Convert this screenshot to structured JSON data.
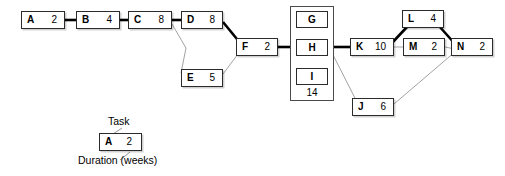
{
  "diagram": {
    "type": "activity-on-node network diagram",
    "critical_path_color": "#000000",
    "normal_edge_color": "#8a8a8a",
    "nodes": [
      {
        "id": "A",
        "task": "A",
        "duration": "2",
        "x": 21,
        "y": 11,
        "w": 44,
        "h": 18
      },
      {
        "id": "B",
        "task": "B",
        "duration": "4",
        "x": 76,
        "y": 11,
        "w": 44,
        "h": 18
      },
      {
        "id": "C",
        "task": "C",
        "duration": "8",
        "x": 128,
        "y": 11,
        "w": 44,
        "h": 18
      },
      {
        "id": "D",
        "task": "D",
        "duration": "8",
        "x": 181,
        "y": 11,
        "w": 42,
        "h": 18
      },
      {
        "id": "E",
        "task": "E",
        "duration": "5",
        "x": 181,
        "y": 69,
        "w": 42,
        "h": 18
      },
      {
        "id": "F",
        "task": "F",
        "duration": "2",
        "x": 236,
        "y": 38,
        "w": 42,
        "h": 18
      },
      {
        "id": "J",
        "task": "J",
        "duration": "6",
        "x": 352,
        "y": 98,
        "w": 42,
        "h": 18
      },
      {
        "id": "K",
        "task": "K",
        "duration": "10",
        "x": 350,
        "y": 38,
        "w": 44,
        "h": 18
      },
      {
        "id": "L",
        "task": "L",
        "duration": "4",
        "x": 402,
        "y": 10,
        "w": 42,
        "h": 18
      },
      {
        "id": "M",
        "task": "M",
        "duration": "2",
        "x": 403,
        "y": 38,
        "w": 42,
        "h": 18
      },
      {
        "id": "N",
        "task": "N",
        "duration": "2",
        "x": 451,
        "y": 38,
        "w": 42,
        "h": 18
      }
    ],
    "group": {
      "id": "GHI",
      "duration": "14",
      "box": {
        "x": 290,
        "y": 6,
        "w": 44,
        "h": 95
      },
      "members": [
        {
          "id": "G",
          "task": "G",
          "x": 296,
          "y": 11,
          "w": 32,
          "h": 17
        },
        {
          "id": "H",
          "task": "H",
          "x": 296,
          "y": 39,
          "w": 32,
          "h": 17
        },
        {
          "id": "I",
          "task": "I",
          "x": 296,
          "y": 68,
          "w": 32,
          "h": 17
        }
      ],
      "duration_pos": {
        "x": 296,
        "y": 88,
        "w": 32
      }
    },
    "edges": [
      {
        "from": "A",
        "to": "B",
        "critical": true,
        "points": "65,20 76,20"
      },
      {
        "from": "B",
        "to": "C",
        "critical": true,
        "points": "120,20 128,20"
      },
      {
        "from": "C",
        "to": "D",
        "critical": true,
        "points": "172,20 181,20"
      },
      {
        "from": "C",
        "to": "E",
        "critical": false,
        "points": "172,24 186,48 181,73"
      },
      {
        "from": "D",
        "to": "F",
        "critical": true,
        "points": "223,22 241,44"
      },
      {
        "from": "E",
        "to": "F",
        "critical": false,
        "points": "223,74 241,50"
      },
      {
        "from": "F",
        "to": "GHI",
        "critical": true,
        "points": "278,47 296,47"
      },
      {
        "from": "GHI",
        "to": "K",
        "critical": true,
        "points": "330,47 350,47"
      },
      {
        "from": "GHI",
        "to": "J",
        "critical": false,
        "points": "330,49 357,102"
      },
      {
        "from": "K",
        "to": "L",
        "critical": true,
        "points": "390,45 407,27"
      },
      {
        "from": "K",
        "to": "M",
        "critical": false,
        "points": "394,47 403,47"
      },
      {
        "from": "L",
        "to": "N",
        "critical": true,
        "points": "439,26 456,45"
      },
      {
        "from": "M",
        "to": "N",
        "critical": false,
        "points": "445,47 455,49"
      },
      {
        "from": "J",
        "to": "N",
        "critical": false,
        "points": "394,104 456,51"
      }
    ]
  },
  "legend": {
    "task_label": "Task",
    "duration_label": "Duration (weeks)",
    "sample": {
      "task": "A",
      "duration": "2"
    },
    "box": {
      "x": 99,
      "y": 133,
      "w": 43,
      "h": 18
    },
    "task_label_pos": {
      "x": 108,
      "y": 116
    },
    "duration_label_pos": {
      "x": 78,
      "y": 155
    },
    "task_leader": "122,128 113,134",
    "duration_leader": "130,152 120,160"
  }
}
